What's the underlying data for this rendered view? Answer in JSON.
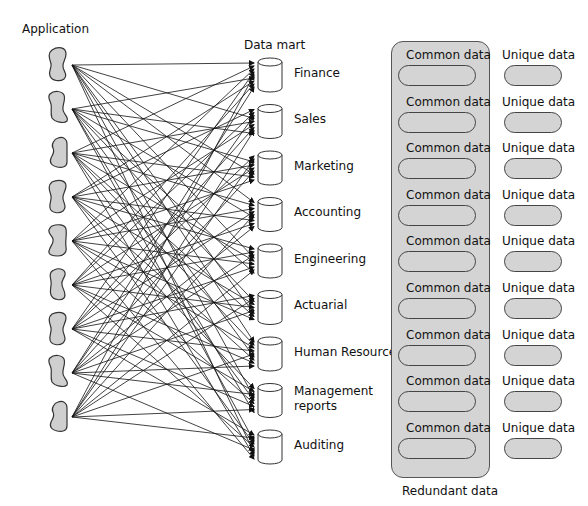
{
  "titles": {
    "application": "Application",
    "data_mart": "Data mart",
    "redundant_data": "Redundant data"
  },
  "applications": [
    {
      "id": 1
    },
    {
      "id": 2
    },
    {
      "id": 3
    },
    {
      "id": 4
    },
    {
      "id": 5
    },
    {
      "id": 6
    },
    {
      "id": 7
    },
    {
      "id": 8
    },
    {
      "id": 9
    }
  ],
  "data_marts": [
    {
      "label": "Finance"
    },
    {
      "label": "Sales"
    },
    {
      "label": "Marketing"
    },
    {
      "label": "Accounting"
    },
    {
      "label": "Engineering"
    },
    {
      "label": "Actuarial"
    },
    {
      "label": "Human Resources"
    },
    {
      "label": "Management reports",
      "line1": "Management",
      "line2": "reports"
    },
    {
      "label": "Auditing"
    }
  ],
  "rows": [
    {
      "common": "Common data",
      "unique": "Unique data"
    },
    {
      "common": "Common data",
      "unique": "Unique data"
    },
    {
      "common": "Common data",
      "unique": "Unique data"
    },
    {
      "common": "Common data",
      "unique": "Unique data"
    },
    {
      "common": "Common data",
      "unique": "Unique data"
    },
    {
      "common": "Common data",
      "unique": "Unique data"
    },
    {
      "common": "Common data",
      "unique": "Unique data"
    },
    {
      "common": "Common data",
      "unique": "Unique data"
    },
    {
      "common": "Common data",
      "unique": "Unique data"
    }
  ],
  "colors": {
    "shape_fill": "#cfcfcf",
    "redundant_fill": "#d4d4d4",
    "stroke": "#444444"
  }
}
